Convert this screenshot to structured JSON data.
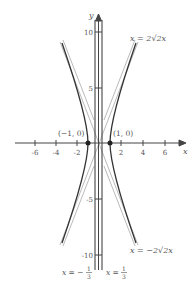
{
  "diagram": {
    "axes": {
      "x_label": "x",
      "y_label": "y",
      "x_ticks": [
        {
          "value": -6,
          "label": "-6"
        },
        {
          "value": -4,
          "label": "-4"
        },
        {
          "value": -2,
          "label": "-2"
        },
        {
          "value": 2,
          "label": "2"
        },
        {
          "value": 4,
          "label": "4"
        },
        {
          "value": 6,
          "label": "6"
        }
      ],
      "y_ticks": [
        {
          "value": 10,
          "label": "10"
        },
        {
          "value": 5,
          "label": "5"
        },
        {
          "value": -5,
          "label": "-5"
        },
        {
          "value": -10,
          "label": "-10"
        }
      ]
    },
    "points": [
      {
        "label": "(−1, 0)",
        "x": -1,
        "y": 0
      },
      {
        "label": "(1, 0)",
        "x": 1,
        "y": 0
      }
    ],
    "curve_labels": {
      "upper": "x = 2√2x",
      "lower": "x = −2√2x"
    },
    "vertical_lines": [
      {
        "label_lhs": "x = −",
        "num": "1",
        "den": "3",
        "x": -0.3333
      },
      {
        "label_lhs": "x = ",
        "num": "1",
        "den": "3",
        "x": 0.3333
      }
    ],
    "colors": {
      "curve": "#3a3a3a",
      "light_line": "#9a9a9a",
      "axis": "#444444",
      "text": "#555555"
    }
  }
}
